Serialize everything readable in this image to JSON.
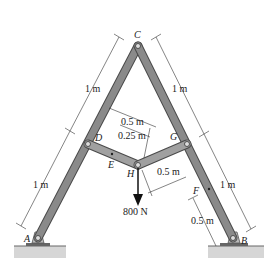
{
  "diagram": {
    "type": "A-frame truss with loaded linkage",
    "points": {
      "A": "A",
      "B": "B",
      "C": "C",
      "D": "D",
      "E": "E",
      "F": "F",
      "G": "G",
      "H": "H"
    },
    "dimensions": {
      "cd_left": "1 m",
      "da_left": "1 m",
      "cg_right": "1 m",
      "gb_right": "1 m",
      "dh": "0.5 m",
      "de": "0.25 m",
      "hg": "0.5 m",
      "fb": "0.5 m"
    },
    "load": {
      "label": "800 N",
      "direction": "down",
      "point": "H"
    },
    "colors": {
      "member_fill": "#8a8a8a",
      "member_edge": "#4a4a4a",
      "ground": "#c8c8c8",
      "dim_line": "#333333"
    }
  }
}
